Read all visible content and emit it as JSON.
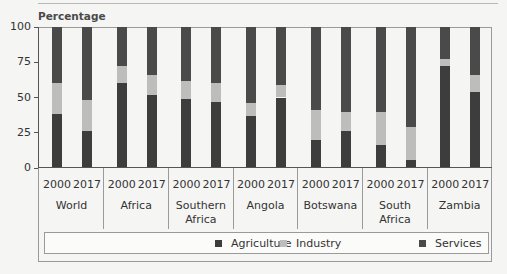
{
  "chart_data": {
    "type": "bar",
    "stacked": true,
    "title": "",
    "ylabel": "Percentage",
    "xlabel": "",
    "ylim": [
      0,
      100
    ],
    "yticks": [
      0,
      25,
      50,
      75,
      100
    ],
    "grid": false,
    "legend_position": "bottom",
    "groups": [
      "World",
      "Africa",
      "Southern Africa",
      "Angola",
      "Botswana",
      "South Africa",
      "Zambia"
    ],
    "years": [
      "2000",
      "2017"
    ],
    "categories": [
      "World 2000",
      "World 2017",
      "Africa 2000",
      "Africa 2017",
      "Southern Africa 2000",
      "Southern Africa 2017",
      "Angola 2000",
      "Angola 2017",
      "Botswana 2000",
      "Botswana 2017",
      "South Africa 2000",
      "South Africa 2017",
      "Zambia 2000",
      "Zambia 2017"
    ],
    "series": [
      {
        "name": "Agriculture",
        "color": "#3d3d3d",
        "values": [
          38,
          26,
          60,
          52,
          49,
          47,
          37,
          50,
          20,
          26,
          16,
          6,
          72,
          54
        ]
      },
      {
        "name": "Industry",
        "color": "#bdbdbb",
        "values": [
          22,
          22,
          12,
          14,
          13,
          13,
          9,
          9,
          21,
          14,
          24,
          23,
          5,
          12
        ]
      },
      {
        "name": "Services",
        "color": "#4a4a4a",
        "values": [
          40,
          52,
          28,
          34,
          38,
          40,
          54,
          41,
          59,
          60,
          60,
          71,
          23,
          34
        ]
      }
    ]
  },
  "axis": {
    "ylabel": "Percentage",
    "ticks": [
      "100",
      "75",
      "50",
      "25",
      "0"
    ]
  },
  "groups": [
    {
      "name": "World",
      "line1": "World",
      "line2": ""
    },
    {
      "name": "Africa",
      "line1": "Africa",
      "line2": ""
    },
    {
      "name": "Southern Africa",
      "line1": "Southern",
      "line2": "Africa"
    },
    {
      "name": "Angola",
      "line1": "Angola",
      "line2": ""
    },
    {
      "name": "Botswana",
      "line1": "Botswana",
      "line2": ""
    },
    {
      "name": "South Africa",
      "line1": "South",
      "line2": "Africa"
    },
    {
      "name": "Zambia",
      "line1": "Zambia",
      "line2": ""
    }
  ],
  "legend": {
    "items": [
      {
        "label": "Agriculture",
        "color": "#3d3d3d"
      },
      {
        "label": "Industry",
        "color": "#bdbdbb"
      },
      {
        "label": "Services",
        "color": "#4a4a4a"
      }
    ]
  }
}
